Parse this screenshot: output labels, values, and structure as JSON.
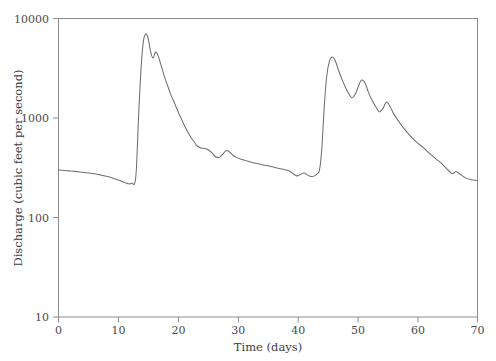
{
  "chart_data": {
    "type": "line",
    "title": "",
    "xlabel": "Time (days)",
    "ylabel": "Discharge (cubic feet per second)",
    "xlim": [
      0,
      70
    ],
    "ylim": [
      10,
      10000
    ],
    "yscale": "log",
    "xscale": "linear",
    "grid": false,
    "legend": null,
    "xticks": [
      0,
      10,
      20,
      30,
      40,
      50,
      60,
      70
    ],
    "xtick_labels": [
      "0",
      "10",
      "20",
      "30",
      "40",
      "50",
      "60",
      "70"
    ],
    "yticks": [
      10,
      100,
      1000,
      10000
    ],
    "ytick_labels": [
      "10",
      "100",
      "1000",
      "10000"
    ],
    "series": [
      {
        "name": "Discharge hydrograph",
        "color": "#6f6f6f",
        "x": [
          0,
          1,
          2,
          3,
          4,
          5,
          6,
          7,
          8,
          9,
          10,
          10.8,
          11.3,
          11.7,
          12.0,
          12.3,
          12.7,
          13.0,
          13.4,
          13.8,
          14.2,
          14.6,
          15.0,
          15.4,
          15.8,
          16.2,
          16.6,
          17.0,
          17.4,
          17.8,
          18.3,
          18.8,
          19.4,
          20.0,
          20.7,
          21.4,
          22.1,
          22.8,
          23.2,
          23.8,
          24.4,
          25.0,
          25.6,
          26.2,
          26.8,
          27.4,
          28.0,
          28.6,
          29.2,
          29.8,
          30.5,
          31.5,
          32.5,
          33.5,
          34.5,
          35.5,
          36.5,
          37.5,
          38.5,
          39.2,
          39.8,
          40.4,
          41.0,
          41.6,
          42.2,
          42.8,
          43.2,
          43.6,
          44.0,
          44.4,
          44.8,
          45.2,
          45.7,
          46.2,
          46.8,
          47.4,
          48.0,
          48.5,
          49.0,
          49.5,
          50.0,
          50.6,
          51.2,
          51.8,
          52.4,
          53.0,
          53.6,
          54.2,
          54.8,
          55.4,
          56.0,
          56.8,
          57.6,
          58.4,
          59.2,
          60.0,
          61.0,
          62.0,
          63.0,
          64.0,
          64.6,
          65.2,
          65.8,
          66.4,
          67.0,
          68.0,
          69.0,
          70.0
        ],
        "y": [
          300,
          297,
          293,
          289,
          285,
          280,
          275,
          268,
          260,
          250,
          238,
          228,
          222,
          218,
          218,
          222,
          218,
          300,
          1100,
          3200,
          6000,
          7000,
          6200,
          4600,
          4000,
          4600,
          4300,
          3600,
          3000,
          2500,
          2050,
          1700,
          1400,
          1150,
          930,
          760,
          640,
          560,
          520,
          500,
          495,
          480,
          450,
          410,
          400,
          430,
          470,
          455,
          420,
          400,
          385,
          370,
          355,
          345,
          335,
          325,
          315,
          305,
          295,
          275,
          262,
          270,
          280,
          268,
          258,
          262,
          275,
          300,
          500,
          1300,
          2600,
          3600,
          4100,
          3800,
          3000,
          2400,
          2000,
          1750,
          1600,
          1700,
          2000,
          2400,
          2250,
          1800,
          1500,
          1300,
          1150,
          1250,
          1450,
          1300,
          1100,
          930,
          800,
          700,
          620,
          560,
          500,
          440,
          390,
          350,
          320,
          295,
          275,
          290,
          275,
          250,
          240,
          235
        ]
      }
    ]
  },
  "axes": {
    "x_title": "Time (days)",
    "y_title": "Discharge (cubic feet per second)",
    "x_tick_labels": [
      "0",
      "10",
      "20",
      "30",
      "40",
      "50",
      "60",
      "70"
    ],
    "y_tick_labels": [
      "10000",
      "1000",
      "100",
      "10"
    ]
  },
  "colors": {
    "curve": "#6f6f6f",
    "axis": "#8c8c8c",
    "text": "#3c3c3c",
    "background": "#ffffff"
  }
}
